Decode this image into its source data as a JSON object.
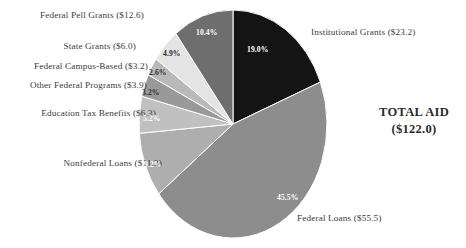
{
  "chart_data": {
    "type": "pie",
    "title": "",
    "subtitle": "",
    "center_text_line1": "TOTAL AID",
    "center_text_line2": "($122.0)",
    "total": 122.0,
    "units": "billions of dollars",
    "start_angle_deg": 0,
    "direction": "clockwise",
    "legend": "callout-labels",
    "grid": false,
    "categories": [
      "Institutional Grants",
      "Federal Loans",
      "Nonfederal Loans",
      "Education Tax Benefits",
      "Other Federal Programs",
      "Federal Campus-Based",
      "State Grants",
      "Federal Pell Grants"
    ],
    "values": [
      23.2,
      55.5,
      11.3,
      6.3,
      3.9,
      3.2,
      6.0,
      12.6
    ],
    "percentages": [
      19.0,
      45.5,
      9.2,
      5.2,
      3.2,
      2.6,
      4.9,
      10.4
    ],
    "colors": [
      "#141414",
      "#8d8d8d",
      "#aeaeae",
      "#c0c0c0",
      "#999999",
      "#b9b9b9",
      "#e4e4e4",
      "#6e6e6e"
    ],
    "slices": [
      {
        "name": "Institutional Grants",
        "label": "Institutional Grants ($23.2)",
        "value": 23.2,
        "percent_label": "19.0%",
        "percent": 19.0,
        "color": "#141414",
        "label_side": "right",
        "pct_color": "light"
      },
      {
        "name": "Federal Loans",
        "label": "Federal Loans ($55.5)",
        "value": 55.5,
        "percent_label": "45.5%",
        "percent": 45.5,
        "color": "#8d8d8d",
        "label_side": "right",
        "pct_color": "light"
      },
      {
        "name": "Nonfederal Loans",
        "label": "Nonfederal Loans ($11.3)",
        "value": 11.3,
        "percent_label": "9.2%",
        "percent": 9.2,
        "color": "#aeaeae",
        "label_side": "left",
        "pct_color": "light"
      },
      {
        "name": "Education Tax Benefits",
        "label": "Education Tax Benefits ($6.3)",
        "value": 6.3,
        "percent_label": "5.2%",
        "percent": 5.2,
        "color": "#c0c0c0",
        "label_side": "left",
        "pct_color": "light"
      },
      {
        "name": "Other Federal Programs",
        "label": "Other Federal Programs ($3.9)",
        "value": 3.9,
        "percent_label": "3.2%",
        "percent": 3.2,
        "color": "#999999",
        "label_side": "left",
        "pct_color": "dark"
      },
      {
        "name": "Federal Campus-Based",
        "label": "Federal Campus-Based ($3.2)",
        "value": 3.2,
        "percent_label": "2.6%",
        "percent": 2.6,
        "color": "#b9b9b9",
        "label_side": "left",
        "pct_color": "dark"
      },
      {
        "name": "State Grants",
        "label": "State Grants ($6.0)",
        "value": 6.0,
        "percent_label": "4.9%",
        "percent": 4.9,
        "color": "#e4e4e4",
        "label_side": "left",
        "pct_color": "dark"
      },
      {
        "name": "Federal Pell Grants",
        "label": "Federal Pell Grants ($12.6)",
        "value": 12.6,
        "percent_label": "10.4%",
        "percent": 10.4,
        "color": "#6e6e6e",
        "label_side": "left",
        "pct_color": "light"
      }
    ]
  }
}
